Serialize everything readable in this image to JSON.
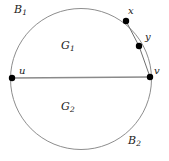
{
  "figure": {
    "type": "diagram",
    "width": 169,
    "height": 161,
    "background_color": "#ffffff",
    "stroke_color": "#808080",
    "dot_color": "#000000",
    "label_color": "#1a1a1a",
    "circle": {
      "cx": 81,
      "cy": 79,
      "r": 70.5
    },
    "chord": {
      "x1": 12,
      "y1": 78,
      "x2": 150,
      "y2": 77
    },
    "points": [
      {
        "id": "u",
        "label": "u",
        "subscript": "",
        "cx": 12,
        "cy": 78,
        "r": 3.2,
        "label_x": 19,
        "label_y": 66
      },
      {
        "id": "v",
        "label": "v",
        "subscript": "",
        "cx": 150,
        "cy": 77,
        "r": 3.2,
        "label_x": 154,
        "label_y": 66
      },
      {
        "id": "x",
        "label": "x",
        "subscript": "",
        "cx": 126,
        "cy": 21,
        "r": 3.2,
        "label_x": 128,
        "label_y": 6
      },
      {
        "id": "y",
        "label": "y",
        "subscript": "",
        "cx": 139,
        "cy": 46,
        "r": 3.2,
        "label_x": 145,
        "label_y": 32
      }
    ],
    "boundary_polyline": "126,21 139,46 150,77",
    "region_labels": [
      {
        "id": "B1",
        "base": "B",
        "sub": "1",
        "x": 14,
        "y": 4,
        "size": "big"
      },
      {
        "id": "G1",
        "base": "G",
        "sub": "1",
        "x": 61,
        "y": 40,
        "size": "big"
      },
      {
        "id": "G2",
        "base": "G",
        "sub": "2",
        "x": 61,
        "y": 101,
        "size": "big"
      },
      {
        "id": "B2",
        "base": "B",
        "sub": "2",
        "x": 128,
        "y": 135,
        "size": "big"
      }
    ]
  }
}
